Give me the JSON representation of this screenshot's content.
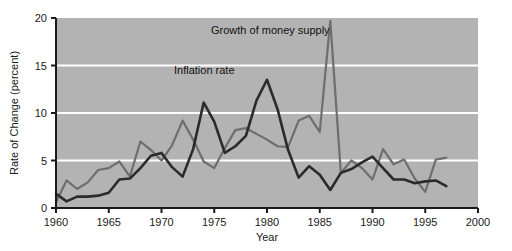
{
  "chart_data": {
    "type": "line",
    "title": "",
    "xlabel": "Year",
    "ylabel": "Rate of Change (percent)",
    "xlim": [
      1960,
      2000
    ],
    "ylim": [
      0,
      20
    ],
    "xticks": [
      1960,
      1965,
      1970,
      1975,
      1980,
      1985,
      1990,
      1995,
      2000
    ],
    "yticks": [
      0,
      5,
      10,
      15,
      20
    ],
    "grid": "horizontal-white-gridlines-at-5-10-15",
    "plot_background": "#b3b3b3",
    "gridline_color": "#ffffff",
    "legend": "inline-annotations",
    "x": [
      1960,
      1961,
      1962,
      1963,
      1964,
      1965,
      1966,
      1967,
      1968,
      1969,
      1970,
      1971,
      1972,
      1973,
      1974,
      1975,
      1976,
      1977,
      1978,
      1979,
      1980,
      1981,
      1982,
      1983,
      1984,
      1985,
      1986,
      1987,
      1988,
      1989,
      1990,
      1991,
      1992,
      1993,
      1994,
      1995,
      1996,
      1997
    ],
    "series": [
      {
        "name": "Growth of money supply",
        "color": "#6e6e6e",
        "values": [
          0.6,
          2.9,
          2.0,
          2.7,
          4.0,
          4.2,
          4.9,
          3.3,
          7.0,
          6.1,
          5.0,
          6.6,
          9.2,
          7.2,
          4.9,
          4.2,
          6.3,
          8.2,
          8.4,
          7.8,
          7.2,
          6.5,
          6.4,
          9.2,
          9.7,
          8.0,
          19.7,
          3.7,
          5.0,
          4.2,
          3.0,
          6.2,
          4.6,
          5.1,
          3.1,
          1.7,
          5.1,
          5.3
        ]
      },
      {
        "name": "Inflation rate",
        "color": "#2b2b2b",
        "values": [
          1.5,
          0.7,
          1.2,
          1.2,
          1.3,
          1.6,
          3.0,
          3.1,
          4.2,
          5.5,
          5.8,
          4.3,
          3.3,
          6.2,
          11.1,
          9.1,
          5.8,
          6.5,
          7.6,
          11.3,
          13.5,
          10.4,
          6.1,
          3.2,
          4.4,
          3.5,
          1.9,
          3.7,
          4.1,
          4.8,
          5.4,
          4.2,
          3.0,
          3.0,
          2.6,
          2.8,
          2.9,
          2.3
        ]
      }
    ],
    "annotations": [
      {
        "text": "Growth of money supply",
        "x_px": 211,
        "y_px": 34,
        "anchor": "start"
      },
      {
        "text": "Inflation rate",
        "x_px": 174,
        "y_px": 74,
        "anchor": "start"
      }
    ]
  },
  "axes": {
    "x_title": "Year",
    "y_title": "Rate of Change (percent)",
    "x_tick_labels": [
      "1960",
      "1965",
      "1970",
      "1975",
      "1980",
      "1985",
      "1990",
      "1995",
      "2000"
    ],
    "y_tick_labels": [
      "0",
      "5",
      "10",
      "15",
      "20"
    ]
  }
}
